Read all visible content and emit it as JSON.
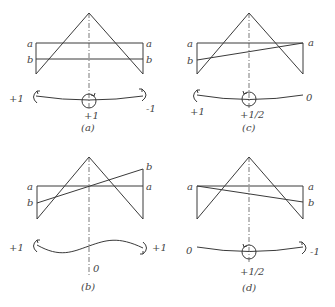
{
  "figure": {
    "panels": [
      {
        "id": "a",
        "caption": "(a)",
        "left_labels": [
          "a",
          "b"
        ],
        "right_labels": [
          "a",
          "b"
        ],
        "moments": {
          "left": "+1",
          "center": "+1",
          "right": "-1"
        },
        "description": "Lines a and b both horizontal; curve sags with moments +1 left, +1 center, -1 right"
      },
      {
        "id": "c",
        "caption": "(c)",
        "left_labels": [
          "a",
          "b"
        ],
        "right_labels": [
          "a"
        ],
        "moments": {
          "left": "+1",
          "center": "+1/2",
          "right": "0"
        },
        "description": "Line b rises from left-b to right-a"
      },
      {
        "id": "b",
        "caption": "(b)",
        "left_labels": [
          "a",
          "b"
        ],
        "right_labels": [
          "b",
          "a"
        ],
        "moments": {
          "left": "+1",
          "center": "0",
          "right": "+1"
        },
        "description": "Line b crosses a at center; S-shaped curve"
      },
      {
        "id": "d",
        "caption": "(d)",
        "left_labels": [
          "a"
        ],
        "right_labels": [
          "a",
          "b"
        ],
        "moments": {
          "left": "0",
          "center": "+1/2",
          "right": "-1"
        },
        "description": "Line b falls from left-a to right-b"
      }
    ]
  }
}
